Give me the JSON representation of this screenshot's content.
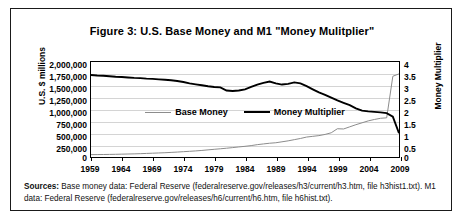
{
  "figure": {
    "title": "Figure 3: U.S. Base Money and M1 \"Money Mulitplier\"",
    "sources_label": "Sources:",
    "sources_text": " Base money data: Federal Reserve (federalreserve.gov/releases/h3/current/h3.htm, file h3hist1.txt). M1 data: Federal Reserve (federalreserve.gov/releases/h6/current/h6.htm, file h6hist.txt)."
  },
  "colors": {
    "base_money_line": "#8c8c8c",
    "money_multiplier_line": "#000000",
    "gridline": "#d4d4d4",
    "axis": "#000000",
    "border": "#1a1a1a",
    "background": "#ffffff"
  },
  "legend": {
    "position": "inside-upper-center",
    "items": [
      {
        "label": "Base Money",
        "style": "thin-gray-line"
      },
      {
        "label": "Money Multiplier",
        "style": "thick-black-line"
      }
    ]
  },
  "chart_data": {
    "type": "line",
    "title": "Figure 3: U.S. Base Money and M1 \"Money Mulitplier\"",
    "xlabel": "",
    "ylabel": "U.S. $ millions",
    "y2label": "Money Multiplier",
    "xlim": [
      1959,
      2009
    ],
    "ylim": [
      0,
      2000000
    ],
    "y2lim": [
      0,
      4
    ],
    "grid": true,
    "xticks": [
      1959,
      1964,
      1969,
      1974,
      1979,
      1984,
      1989,
      1994,
      1999,
      2004,
      2009
    ],
    "xticklabels": [
      "1959",
      "1964",
      "1969",
      "1974",
      "1979",
      "1984",
      "1989",
      "1994",
      "1999",
      "2004",
      "2009"
    ],
    "yticks": [
      0,
      250000,
      500000,
      750000,
      1000000,
      1250000,
      1500000,
      1750000,
      2000000
    ],
    "yticklabels": [
      "0",
      "250,000",
      "500,000",
      "750,000",
      "1,000,000",
      "1,250,000",
      "1,500,000",
      "1,750,000",
      "2,000,000"
    ],
    "y2ticks": [
      0,
      0.5,
      1,
      1.5,
      2,
      2.5,
      3,
      3.5,
      4
    ],
    "y2ticklabels": [
      "0",
      "0.5",
      "1",
      "1.5",
      "2",
      "2.5",
      "3",
      "3.5",
      "4"
    ],
    "x": [
      1959,
      1960,
      1961,
      1962,
      1963,
      1964,
      1965,
      1966,
      1967,
      1968,
      1969,
      1970,
      1971,
      1972,
      1973,
      1974,
      1975,
      1976,
      1977,
      1978,
      1979,
      1980,
      1981,
      1982,
      1983,
      1984,
      1985,
      1986,
      1987,
      1988,
      1989,
      1990,
      1991,
      1992,
      1993,
      1994,
      1995,
      1996,
      1997,
      1998,
      1999,
      2000,
      2001,
      2002,
      2003,
      2004,
      2005,
      2006,
      2007,
      2008,
      2009
    ],
    "series": [
      {
        "name": "Base Money",
        "axis": "left",
        "units": "U.S. $ millions",
        "values": [
          50000,
          51000,
          52500,
          54500,
          57000,
          60000,
          63000,
          66000,
          70000,
          75000,
          80000,
          85000,
          90000,
          97000,
          104000,
          112000,
          120000,
          128000,
          138000,
          150000,
          162000,
          173000,
          185000,
          198000,
          212000,
          225000,
          240000,
          260000,
          275000,
          290000,
          300000,
          320000,
          340000,
          365000,
          390000,
          420000,
          435000,
          450000,
          475000,
          510000,
          595000,
          590000,
          635000,
          680000,
          720000,
          760000,
          790000,
          815000,
          825000,
          1700000,
          1750000
        ]
      },
      {
        "name": "Money Multiplier",
        "axis": "right",
        "units": "ratio",
        "values": [
          3.45,
          3.43,
          3.42,
          3.4,
          3.38,
          3.37,
          3.35,
          3.33,
          3.32,
          3.3,
          3.29,
          3.27,
          3.25,
          3.23,
          3.2,
          3.16,
          3.1,
          3.06,
          3.02,
          2.98,
          2.95,
          2.93,
          2.8,
          2.78,
          2.8,
          2.85,
          2.95,
          3.05,
          3.12,
          3.18,
          3.1,
          3.05,
          3.08,
          3.14,
          3.1,
          2.98,
          2.85,
          2.72,
          2.62,
          2.5,
          2.38,
          2.28,
          2.18,
          2.05,
          1.95,
          1.92,
          1.9,
          1.88,
          1.85,
          1.7,
          1.0
        ]
      }
    ],
    "annotations": [
      "Money Multiplier collapses from ~1.7 to ~1.0 in 2008-2009",
      "Base Money spikes from ~825,000 to ~1,750,000 in 2008-2009"
    ]
  }
}
